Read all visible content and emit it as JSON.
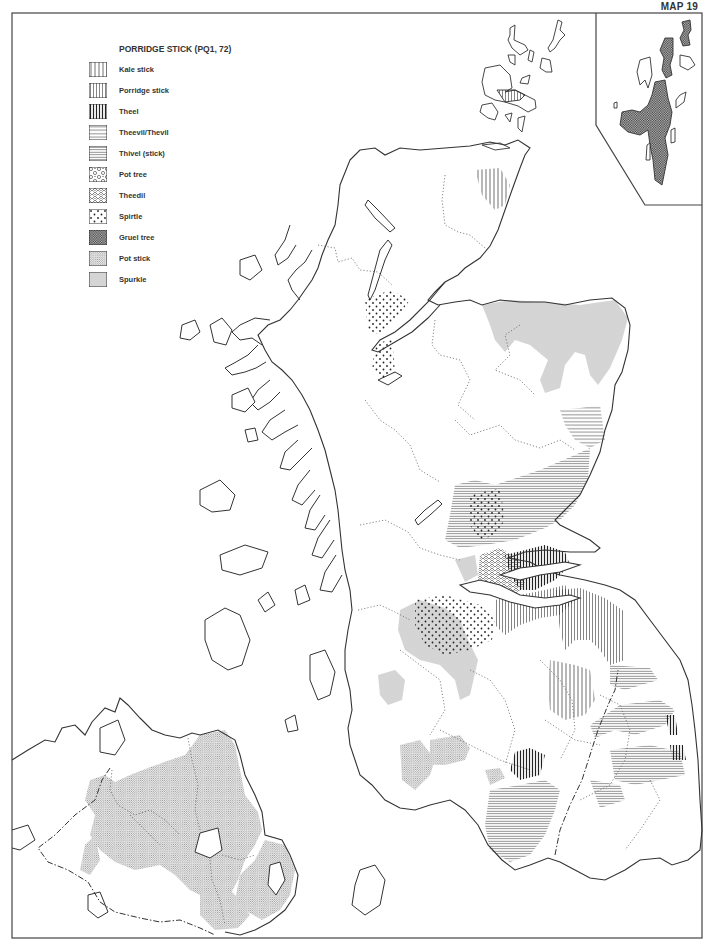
{
  "map": {
    "number_label": "MAP 19",
    "title": "PORRIDGE STICK (PQ1, 72)",
    "colors": {
      "ink": "#333333",
      "spurkle_fill": "#d6d6d6",
      "background": "#ffffff"
    }
  },
  "legend": {
    "items": [
      {
        "label": "Kale stick",
        "pattern": "kale-stick"
      },
      {
        "label": "Porridge stick",
        "pattern": "porridge-stick"
      },
      {
        "label": "Theel",
        "pattern": "theel"
      },
      {
        "label": "Theevil/Thevil",
        "pattern": "theevil"
      },
      {
        "label": "Thivel (stick)",
        "pattern": "thivel"
      },
      {
        "label": "Pot tree",
        "pattern": "pot-tree"
      },
      {
        "label": "Theedil",
        "pattern": "theedil"
      },
      {
        "label": "Spirtle",
        "pattern": "spirtle"
      },
      {
        "label": "Gruel tree",
        "pattern": "gruel-tree"
      },
      {
        "label": "Pot stick",
        "pattern": "pot-stick"
      },
      {
        "label": "Spurkle",
        "pattern": "spurkle"
      }
    ]
  }
}
